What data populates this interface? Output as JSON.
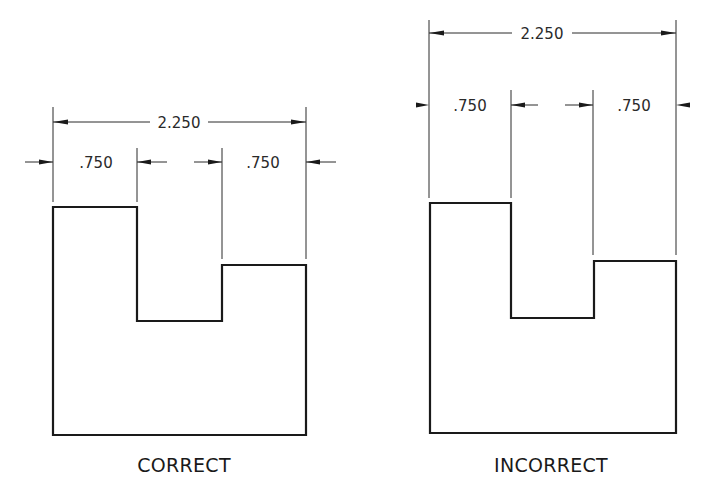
{
  "figure": {
    "panels": [
      {
        "id": "correct",
        "caption": "CORRECT",
        "overall_dimension": "2.250",
        "left_dimension": ".750",
        "right_dimension": ".750"
      },
      {
        "id": "incorrect",
        "caption": "INCORRECT",
        "overall_dimension": "2.250",
        "left_dimension": ".750",
        "right_dimension": ".750"
      }
    ]
  },
  "colors": {
    "line": "#1a1a1a",
    "background": "#ffffff"
  }
}
